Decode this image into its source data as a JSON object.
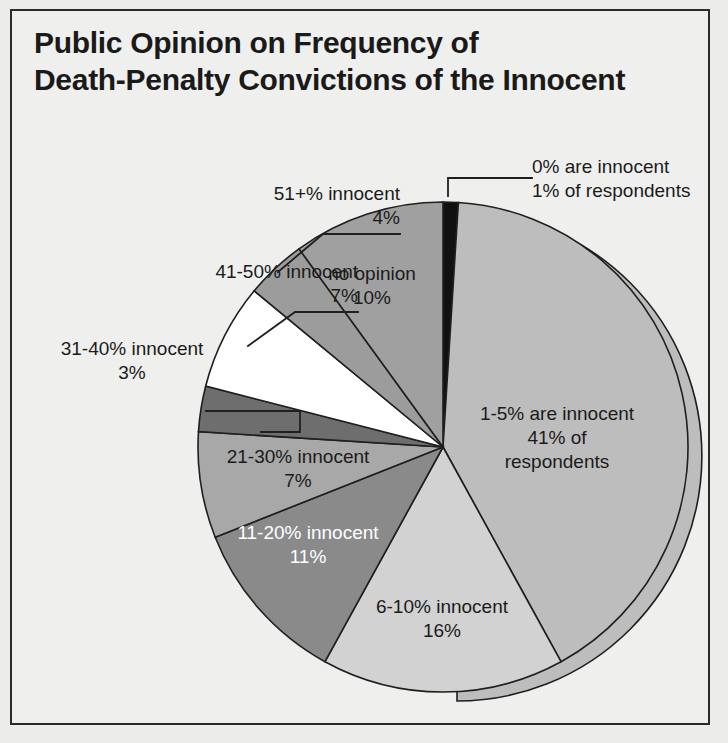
{
  "figure": {
    "title_line1": "Public Opinion on Frequency of",
    "title_line2": "Death-Penalty Convictions of the Innocent",
    "background_color": "#ececeb",
    "frame_color": "#2b2b2b",
    "text_color": "#1b1b1b"
  },
  "chart_data": {
    "type": "pie",
    "title": "Public Opinion on Frequency of Death-Penalty Convictions of the Innocent",
    "xlabel": "",
    "ylabel": "",
    "units": "percent of respondents",
    "total": 100,
    "legend_position": "none",
    "grid": false,
    "start_angle_deg": 0,
    "direction": "clockwise",
    "categories": [
      "0% are innocent",
      "1-5% are innocent",
      "6-10% innocent",
      "11-20% innocent",
      "21-30% innocent",
      "31-40% innocent",
      "41-50% innocent",
      "51+% innocent",
      "no opinion"
    ],
    "values": [
      1,
      41,
      16,
      11,
      7,
      3,
      7,
      4,
      10
    ],
    "colors": [
      "#111111",
      "#bdbdbd",
      "#d2d2d2",
      "#8a8a8a",
      "#a8a8a8",
      "#6e6e6e",
      "#ffffff",
      "#9c9c9c",
      "#a0a0a0"
    ],
    "slices": [
      {
        "name": "0% are innocent",
        "value": 1,
        "label_line1": "0% are innocent",
        "label_line2": "1% of respondents",
        "color": "#111111",
        "callout": true,
        "text_color": "#1b1b1b"
      },
      {
        "name": "1-5% are innocent",
        "value": 41,
        "label_line1": "1-5% are innocent",
        "label_line2": "41% of",
        "label_line3": "respondents",
        "color": "#bdbdbd",
        "callout": false,
        "text_color": "#1b1b1b"
      },
      {
        "name": "6-10% innocent",
        "value": 16,
        "label_line1": "6-10% innocent",
        "label_line2": "16%",
        "color": "#d2d2d2",
        "callout": false,
        "text_color": "#1b1b1b"
      },
      {
        "name": "11-20% innocent",
        "value": 11,
        "label_line1": "11-20% innocent",
        "label_line2": "11%",
        "color": "#8a8a8a",
        "callout": false,
        "text_color": "#ffffff"
      },
      {
        "name": "21-30% innocent",
        "value": 7,
        "label_line1": "21-30% innocent",
        "label_line2": "7%",
        "color": "#a8a8a8",
        "callout": false,
        "text_color": "#1b1b1b"
      },
      {
        "name": "31-40% innocent",
        "value": 3,
        "label_line1": "31-40% innocent",
        "label_line2": "3%",
        "color": "#6e6e6e",
        "callout": true,
        "text_color": "#1b1b1b"
      },
      {
        "name": "41-50% innocent",
        "value": 7,
        "label_line1": "41-50% innocent",
        "label_line2": "7%",
        "color": "#ffffff",
        "callout": true,
        "text_color": "#1b1b1b"
      },
      {
        "name": "51+% innocent",
        "value": 4,
        "label_line1": "51+% innocent",
        "label_line2": "4%",
        "color": "#9c9c9c",
        "callout": true,
        "text_color": "#1b1b1b"
      },
      {
        "name": "no opinion",
        "value": 10,
        "label_line1": "no opinion",
        "label_line2": "10%",
        "color": "#a0a0a0",
        "callout": false,
        "text_color": "#1b1b1b"
      }
    ]
  },
  "labels": {
    "zero_l1": "0% are innocent",
    "zero_l2": "1% of respondents",
    "fiftyone_l1": "51+% innocent",
    "fiftyone_l2": "4%",
    "fortyone_l1": "41-50% innocent",
    "fortyone_l2": "7%",
    "thirtyone_l1": "31-40% innocent",
    "thirtyone_l2": "3%",
    "twentyone_l1": "21-30% innocent",
    "twentyone_l2": "7%",
    "eleven_l1": "11-20% innocent",
    "eleven_l2": "11%",
    "six_l1": "6-10% innocent",
    "six_l2": "16%",
    "one_l1": "1-5% are innocent",
    "one_l2": "41% of",
    "one_l3": "respondents",
    "noop_l1": "no opinion",
    "noop_l2": "10%"
  }
}
